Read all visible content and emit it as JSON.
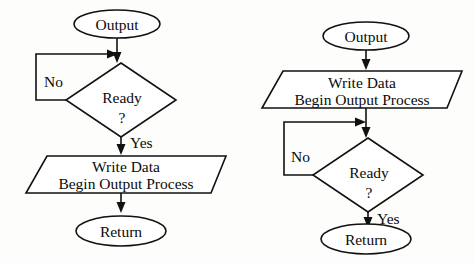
{
  "figure": {
    "background_color": "#fdfdfb",
    "line_color": "#111111",
    "shape_fill": "#ffffff",
    "text_color": "#0b0b0b"
  },
  "diagrams": [
    {
      "id": "left",
      "name": "poll-then-write",
      "description": "Test device ready before writing data",
      "nodes": [
        {
          "id": "l-start",
          "shape": "ellipse",
          "label": "Output"
        },
        {
          "id": "l-decision",
          "shape": "diamond",
          "label": "Ready",
          "sublabel": "?"
        },
        {
          "id": "l-process",
          "shape": "trapezoid",
          "label_line1": "Write Data",
          "label_line2": "Begin Output Process"
        },
        {
          "id": "l-end",
          "shape": "ellipse",
          "label": "Return"
        }
      ],
      "edges": [
        {
          "from": "l-start",
          "to": "l-decision",
          "label": ""
        },
        {
          "from": "l-decision",
          "to": "l-decision",
          "label": "No",
          "type": "loop-back"
        },
        {
          "from": "l-decision",
          "to": "l-process",
          "label": "Yes"
        },
        {
          "from": "l-process",
          "to": "l-end",
          "label": ""
        }
      ]
    },
    {
      "id": "right",
      "name": "write-then-poll",
      "description": "Write data first, then test device ready",
      "nodes": [
        {
          "id": "r-start",
          "shape": "ellipse",
          "label": "Output"
        },
        {
          "id": "r-process",
          "shape": "trapezoid",
          "label_line1": "Write Data",
          "label_line2": "Begin Output Process"
        },
        {
          "id": "r-decision",
          "shape": "diamond",
          "label": "Ready",
          "sublabel": "?"
        },
        {
          "id": "r-end",
          "shape": "ellipse",
          "label": "Return"
        }
      ],
      "edges": [
        {
          "from": "r-start",
          "to": "r-process",
          "label": ""
        },
        {
          "from": "r-process",
          "to": "r-decision",
          "label": ""
        },
        {
          "from": "r-decision",
          "to": "r-decision",
          "label": "No",
          "type": "loop-back"
        },
        {
          "from": "r-decision",
          "to": "r-end",
          "label": "Yes"
        }
      ]
    }
  ],
  "labels": {
    "left": {
      "start": "Output",
      "decision": "Ready",
      "decision_q": "?",
      "no": "No",
      "yes": "Yes",
      "process_line1": "Write Data",
      "process_line2": "Begin Output Process",
      "end": "Return"
    },
    "right": {
      "start": "Output",
      "process_line1": "Write Data",
      "process_line2": "Begin Output Process",
      "no": "No",
      "decision": "Ready",
      "decision_q": "?",
      "yes": "Yes",
      "end": "Return"
    }
  }
}
